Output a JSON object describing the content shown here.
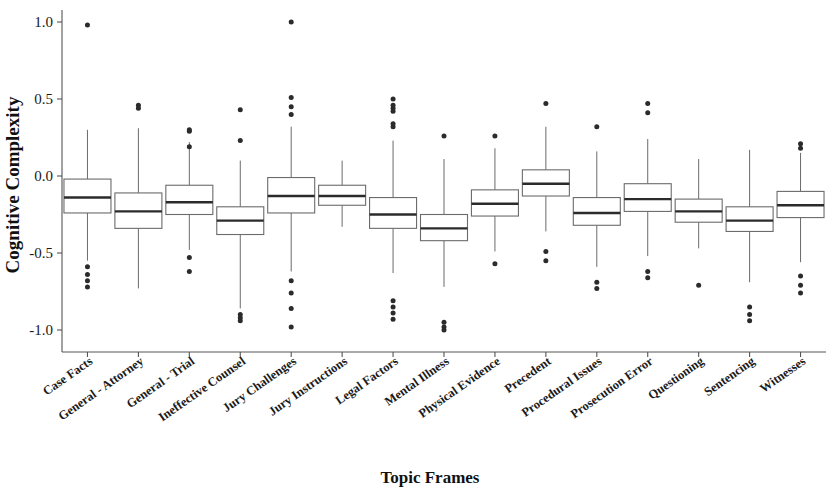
{
  "chart_data": {
    "type": "box",
    "title": "",
    "xlabel": "Topic Frames",
    "ylabel": "Cognitive Complexity",
    "ylim": [
      -1.12,
      1.08
    ],
    "yticks": [
      1.0,
      0.5,
      0.0,
      -0.5,
      -1.0
    ],
    "ytick_labels": [
      "1.0",
      "0.5",
      "0.0",
      "-0.5",
      "-1.0"
    ],
    "grid": false,
    "legend": "none",
    "orientation": "vertical",
    "categories": [
      "Case Facts",
      "General - Attorney",
      "General - Trial",
      "Ineffective Counsel",
      "Jury Challenges",
      "Jury Instructions",
      "Legal Factors",
      "Mental Illness",
      "Physical Evidence",
      "Precedent",
      "Procedural Issues",
      "Prosecution Error",
      "Questioning",
      "Sentencing",
      "Witnesses"
    ],
    "boxes": [
      {
        "category": "Case Facts",
        "whisker_low": -0.55,
        "q1": -0.24,
        "median": -0.14,
        "q3": -0.02,
        "whisker_high": 0.3,
        "outliers": [
          0.98,
          -0.59,
          -0.64,
          -0.68,
          -0.72
        ]
      },
      {
        "category": "General - Attorney",
        "whisker_low": -0.73,
        "q1": -0.34,
        "median": -0.23,
        "q3": -0.11,
        "whisker_high": 0.31,
        "outliers": [
          0.46,
          0.44
        ]
      },
      {
        "category": "General - Trial",
        "whisker_low": -0.48,
        "q1": -0.25,
        "median": -0.17,
        "q3": -0.06,
        "whisker_high": 0.22,
        "outliers": [
          0.3,
          0.29,
          0.19,
          -0.53,
          -0.62
        ]
      },
      {
        "category": "Ineffective Counsel",
        "whisker_low": -0.86,
        "q1": -0.38,
        "median": -0.29,
        "q3": -0.2,
        "whisker_high": 0.1,
        "outliers": [
          0.43,
          0.23,
          -0.9,
          -0.92,
          -0.94
        ]
      },
      {
        "category": "Jury Challenges",
        "whisker_low": -0.62,
        "q1": -0.24,
        "median": -0.13,
        "q3": -0.01,
        "whisker_high": 0.32,
        "outliers": [
          1.0,
          0.51,
          0.45,
          0.4,
          -0.68,
          -0.76,
          -0.86,
          -0.98
        ]
      },
      {
        "category": "Jury Instructions",
        "whisker_low": -0.33,
        "q1": -0.19,
        "median": -0.13,
        "q3": -0.06,
        "whisker_high": 0.1,
        "outliers": []
      },
      {
        "category": "Legal Factors",
        "whisker_low": -0.63,
        "q1": -0.34,
        "median": -0.25,
        "q3": -0.14,
        "whisker_high": 0.23,
        "outliers": [
          0.5,
          0.46,
          0.44,
          0.42,
          0.34,
          0.32,
          -0.81,
          -0.85,
          -0.89,
          -0.93
        ]
      },
      {
        "category": "Mental Illness",
        "whisker_low": -0.72,
        "q1": -0.42,
        "median": -0.34,
        "q3": -0.25,
        "whisker_high": 0.11,
        "outliers": [
          0.26,
          -0.95,
          -0.98,
          -1.0
        ]
      },
      {
        "category": "Physical Evidence",
        "whisker_low": -0.49,
        "q1": -0.26,
        "median": -0.18,
        "q3": -0.09,
        "whisker_high": 0.18,
        "outliers": [
          0.26,
          -0.57
        ]
      },
      {
        "category": "Precedent",
        "whisker_low": -0.36,
        "q1": -0.13,
        "median": -0.05,
        "q3": 0.04,
        "whisker_high": 0.32,
        "outliers": [
          0.47,
          -0.49,
          -0.55
        ]
      },
      {
        "category": "Procedural Issues",
        "whisker_low": -0.59,
        "q1": -0.32,
        "median": -0.24,
        "q3": -0.14,
        "whisker_high": 0.16,
        "outliers": [
          0.32,
          -0.69,
          -0.73
        ]
      },
      {
        "category": "Prosecution Error",
        "whisker_low": -0.52,
        "q1": -0.23,
        "median": -0.15,
        "q3": -0.05,
        "whisker_high": 0.24,
        "outliers": [
          0.47,
          0.41,
          -0.62,
          -0.66
        ]
      },
      {
        "category": "Questioning",
        "whisker_low": -0.47,
        "q1": -0.3,
        "median": -0.23,
        "q3": -0.15,
        "whisker_high": 0.11,
        "outliers": [
          -0.71
        ]
      },
      {
        "category": "Sentencing",
        "whisker_low": -0.69,
        "q1": -0.36,
        "median": -0.29,
        "q3": -0.2,
        "whisker_high": 0.17,
        "outliers": [
          -0.85,
          -0.9,
          -0.94
        ]
      },
      {
        "category": "Witnesses",
        "whisker_low": -0.56,
        "q1": -0.27,
        "median": -0.19,
        "q3": -0.1,
        "whisker_high": 0.15,
        "outliers": [
          0.21,
          0.18,
          -0.65,
          -0.71,
          -0.76
        ]
      }
    ]
  }
}
